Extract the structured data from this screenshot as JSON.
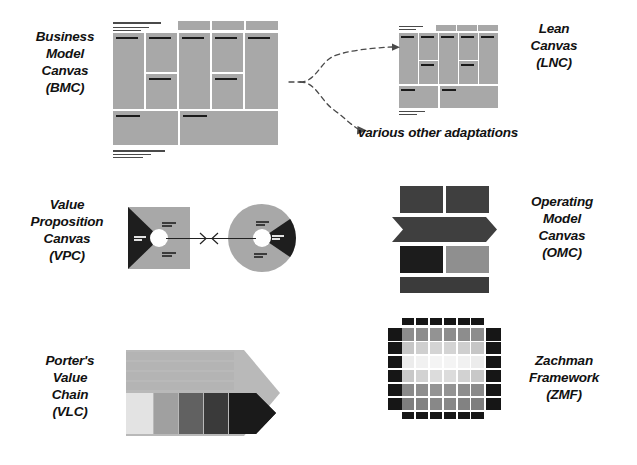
{
  "figure": {
    "kind": "business-framework-comparison-diagram",
    "background": "#ffffff"
  },
  "labels": {
    "bmc": "Business\nModel\nCanvas\n(BMC)",
    "lnc": "Lean\nCanvas\n(LNC)",
    "vpc": "Value\nProposition\nCanvas\n(VPC)",
    "omc": "Operating\nModel\nCanvas\n(OMC)",
    "vlc": "Porter's\nValue\nChain\n(VLC)",
    "zmf": "Zachman\nFramework\n(ZMF)",
    "various": "various other adaptations"
  },
  "colors": {
    "canvas_fill": "#a8a8a8",
    "dark": "#1a1a1a",
    "text": "#111111",
    "omc_top": "#3f3f3f",
    "omc_chevron": "#3f3f3f",
    "omc_mid_dark": "#1c1c1c",
    "omc_mid_light": "#8f8f8f",
    "omc_bottom": "#3b3b3b",
    "vlc_support": "#b4b4b4",
    "vlc_outline": "#b9b9b9",
    "vlc_primary": [
      "#e3e3e3",
      "#a0a0a0",
      "#616161",
      "#3a3a3a",
      "#1a1a1a"
    ],
    "zmf_header": "#161616",
    "zmf_interior": [
      "#8a8a8a",
      "#c2c2c2",
      "#ececec",
      "#d2d2d2",
      "#8e8e8e",
      "#7e7e7e"
    ],
    "vpc_fill": "#a8a8a8",
    "vpc_wedge": "#1e1e1e",
    "arrow": "#4a4a4a"
  },
  "bmc": {
    "title": "Business Model Canvas",
    "top_rules": [
      {
        "x": 113,
        "y": 22,
        "w": 48,
        "h": 1.6
      },
      {
        "x": 113,
        "y": 27,
        "w": 36,
        "h": 1.1
      },
      {
        "x": 113,
        "y": 30,
        "w": 28,
        "h": 0.9
      }
    ],
    "bottom_rules": [
      {
        "x": 113,
        "y": 150,
        "w": 52,
        "h": 1.6
      },
      {
        "x": 113,
        "y": 154,
        "w": 38,
        "h": 1.1
      },
      {
        "x": 113,
        "y": 157,
        "w": 30,
        "h": 0.9
      }
    ],
    "header_strips": [
      {
        "x": 178,
        "y": 21,
        "w": 32,
        "h": 9
      },
      {
        "x": 212,
        "y": 21,
        "w": 32,
        "h": 9
      },
      {
        "x": 246,
        "y": 21,
        "w": 32,
        "h": 9
      }
    ],
    "cells": [
      {
        "x": 113,
        "y": 33,
        "w": 31,
        "h": 76,
        "tick": {
          "x": 3,
          "y": 4,
          "w": 22
        }
      },
      {
        "x": 146,
        "y": 33,
        "w": 31,
        "h": 39,
        "tick": {
          "x": 3,
          "y": 4,
          "w": 22
        }
      },
      {
        "x": 146,
        "y": 74,
        "w": 31,
        "h": 35,
        "tick": {
          "x": 3,
          "y": 4,
          "w": 22
        }
      },
      {
        "x": 179,
        "y": 33,
        "w": 31,
        "h": 76,
        "tick": {
          "x": 3,
          "y": 4,
          "w": 22
        }
      },
      {
        "x": 212,
        "y": 33,
        "w": 31,
        "h": 39,
        "tick": {
          "x": 3,
          "y": 4,
          "w": 22
        }
      },
      {
        "x": 212,
        "y": 74,
        "w": 31,
        "h": 35,
        "tick": {
          "x": 3,
          "y": 4,
          "w": 22
        }
      },
      {
        "x": 245,
        "y": 33,
        "w": 33,
        "h": 76,
        "tick": {
          "x": 3,
          "y": 4,
          "w": 22
        }
      },
      {
        "x": 113,
        "y": 111,
        "w": 65,
        "h": 34,
        "tick": {
          "x": 3,
          "y": 4,
          "w": 24
        }
      },
      {
        "x": 180,
        "y": 111,
        "w": 98,
        "h": 34,
        "tick": {
          "x": 3,
          "y": 4,
          "w": 24
        }
      }
    ]
  },
  "lnc": {
    "title": "Lean Canvas",
    "top_rules": [
      {
        "x": 399,
        "y": 26,
        "w": 24,
        "h": 1.3
      },
      {
        "x": 399,
        "y": 29,
        "w": 17,
        "h": 0.9
      }
    ],
    "bottom_rules": [
      {
        "x": 399,
        "y": 111,
        "w": 26,
        "h": 1.3
      },
      {
        "x": 399,
        "y": 114,
        "w": 18,
        "h": 0.9
      }
    ],
    "header_strips": [
      {
        "x": 436,
        "y": 25,
        "w": 20,
        "h": 6
      },
      {
        "x": 457,
        "y": 25,
        "w": 20,
        "h": 6
      },
      {
        "x": 478,
        "y": 25,
        "w": 20,
        "h": 6
      }
    ],
    "cells": [
      {
        "x": 399,
        "y": 33,
        "w": 19,
        "h": 51,
        "tick": {
          "x": 2,
          "y": 3,
          "w": 13
        }
      },
      {
        "x": 419,
        "y": 33,
        "w": 19,
        "h": 27,
        "tick": {
          "x": 2,
          "y": 3,
          "w": 13
        }
      },
      {
        "x": 419,
        "y": 61,
        "w": 19,
        "h": 23,
        "tick": {
          "x": 2,
          "y": 3,
          "w": 13
        }
      },
      {
        "x": 439,
        "y": 33,
        "w": 19,
        "h": 51,
        "tick": {
          "x": 2,
          "y": 3,
          "w": 13
        }
      },
      {
        "x": 459,
        "y": 33,
        "w": 19,
        "h": 27,
        "tick": {
          "x": 2,
          "y": 3,
          "w": 13
        }
      },
      {
        "x": 459,
        "y": 61,
        "w": 19,
        "h": 23,
        "tick": {
          "x": 2,
          "y": 3,
          "w": 13
        }
      },
      {
        "x": 479,
        "y": 33,
        "w": 19,
        "h": 51,
        "tick": {
          "x": 2,
          "y": 3,
          "w": 13
        }
      },
      {
        "x": 399,
        "y": 86,
        "w": 39,
        "h": 22,
        "tick": {
          "x": 2,
          "y": 3,
          "w": 14
        }
      },
      {
        "x": 440,
        "y": 86,
        "w": 58,
        "h": 22,
        "tick": {
          "x": 2,
          "y": 3,
          "w": 14
        }
      }
    ]
  },
  "vpc": {
    "square": {
      "x": 128,
      "y": 207,
      "w": 62,
      "h": 62
    },
    "circle": {
      "x": 228,
      "y": 204,
      "w": 68,
      "h": 68
    },
    "hub_left": {
      "x": 150,
      "y": 229,
      "w": 18,
      "h": 18
    },
    "hub_right": {
      "x": 253,
      "y": 229,
      "w": 18,
      "h": 18
    },
    "connector": {
      "x": 166,
      "y": 238,
      "w": 60
    }
  },
  "omc": {
    "top_boxes": [
      {
        "x": 400,
        "y": 186,
        "w": 43,
        "h": 27
      },
      {
        "x": 446,
        "y": 186,
        "w": 43,
        "h": 27
      }
    ],
    "chevron": {
      "x": 392,
      "y": 217,
      "w": 105,
      "h": 25
    },
    "mid_boxes": [
      {
        "x": 400,
        "y": 246,
        "w": 43,
        "h": 27
      },
      {
        "x": 446,
        "y": 246,
        "w": 43,
        "h": 27
      }
    ],
    "bottom_box": {
      "x": 400,
      "y": 277,
      "w": 89,
      "h": 16
    }
  },
  "vlc": {
    "support_bars": [
      {
        "x": 126,
        "y": 352,
        "w": 108,
        "h": 8
      },
      {
        "x": 126,
        "y": 362,
        "w": 108,
        "h": 8
      },
      {
        "x": 126,
        "y": 372,
        "w": 108,
        "h": 8
      },
      {
        "x": 126,
        "y": 382,
        "w": 108,
        "h": 8
      }
    ],
    "primary_boxes": [
      {
        "x": 126,
        "y": 393,
        "w": 27,
        "h": 41
      },
      {
        "x": 154,
        "y": 393,
        "w": 24,
        "h": 41
      },
      {
        "x": 179,
        "y": 393,
        "w": 24,
        "h": 41
      },
      {
        "x": 204,
        "y": 393,
        "w": 24,
        "h": 41
      },
      {
        "x": 229,
        "y": 393,
        "w": 27,
        "h": 41
      }
    ],
    "arrow_tip": {
      "x": 234,
      "y": 348,
      "w": 46,
      "h": 90
    }
  },
  "zmf": {
    "origin": {
      "x": 388,
      "y": 328
    },
    "cell": {
      "w": 12.5,
      "h": 12.5,
      "gap": 1.4
    },
    "cols": 6,
    "rows": 6,
    "interior_rows": [
      [
        "#8d8d8d",
        "#8d8d8d",
        "#939393",
        "#8d8d8d",
        "#8d8d8d",
        "#8d8d8d"
      ],
      [
        "#c6c6c6",
        "#cfcfcf",
        "#d4d4d4",
        "#d4d4d4",
        "#cfcfcf",
        "#c6c6c6"
      ],
      [
        "#ececec",
        "#f1f1f1",
        "#f4f4f4",
        "#f4f4f4",
        "#f1f1f1",
        "#ececec"
      ],
      [
        "#c8c8c8",
        "#d2d2d2",
        "#dcdcdc",
        "#dcdcdc",
        "#d2d2d2",
        "#c8c8c8"
      ],
      [
        "#8a8a8a",
        "#8e8e8e",
        "#949494",
        "#949494",
        "#8e8e8e",
        "#8a8a8a"
      ],
      [
        "#7e7e7e",
        "#828282",
        "#888888",
        "#888888",
        "#828282",
        "#7e7e7e"
      ]
    ]
  },
  "label_positions": {
    "bmc": {
      "x": 22,
      "y": 28,
      "w": 86
    },
    "lnc": {
      "x": 508,
      "y": 20,
      "w": 92
    },
    "vpc": {
      "x": 18,
      "y": 196,
      "w": 98
    },
    "omc": {
      "x": 510,
      "y": 193,
      "w": 104
    },
    "vlc": {
      "x": 22,
      "y": 352,
      "w": 96
    },
    "zmf": {
      "x": 508,
      "y": 352,
      "w": 112
    },
    "various": {
      "x": 358,
      "y": 124,
      "w": 210
    }
  }
}
